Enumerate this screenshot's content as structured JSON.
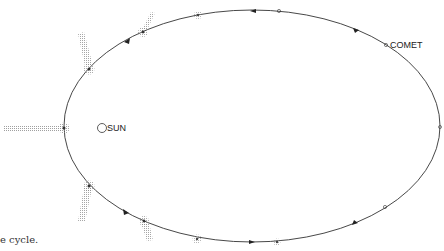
{
  "diagram": {
    "labels": {
      "sun": "SUN",
      "comet": "COMET"
    },
    "caption_fragment": "e cycle.",
    "colors": {
      "orbit": "#333333",
      "tail": "#9a9a9a",
      "coma": "#8a8a8a",
      "text": "#222222"
    },
    "comet_positions": [
      {
        "name": "comet-aphelion-label",
        "stage": "far",
        "has_coma": false,
        "tail": "none"
      },
      {
        "name": "comet-right",
        "stage": "far",
        "has_coma": false,
        "tail": "none"
      },
      {
        "name": "comet-lower-right",
        "stage": "far",
        "has_coma": false,
        "tail": "none"
      },
      {
        "name": "comet-bottom",
        "stage": "approaching",
        "has_coma": true,
        "tail": "none"
      },
      {
        "name": "comet-bottom-left",
        "stage": "near",
        "has_coma": true,
        "tail": "short"
      },
      {
        "name": "comet-lower-left",
        "stage": "near",
        "has_coma": true,
        "tail": "long"
      },
      {
        "name": "comet-perihelion",
        "stage": "perihelion",
        "has_coma": true,
        "tail": "longest"
      },
      {
        "name": "comet-upper-left",
        "stage": "near",
        "has_coma": true,
        "tail": "long"
      },
      {
        "name": "comet-top-left",
        "stage": "receding",
        "has_coma": true,
        "tail": "short"
      },
      {
        "name": "comet-top",
        "stage": "receding",
        "has_coma": true,
        "tail": "none"
      },
      {
        "name": "comet-top-right",
        "stage": "far",
        "has_coma": false,
        "tail": "none"
      }
    ],
    "direction": "counter-clockwise"
  }
}
